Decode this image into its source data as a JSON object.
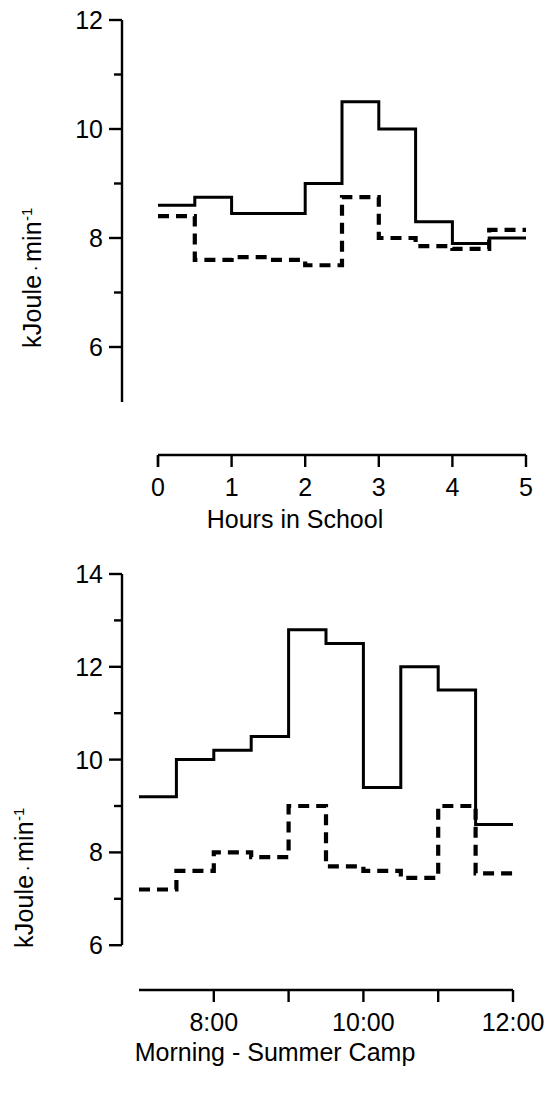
{
  "figure": {
    "background": "#ffffff",
    "line_color": "#000000",
    "panels": [
      "school",
      "camp"
    ]
  },
  "chart_data": [
    {
      "id": "school",
      "type": "line",
      "subtype": "step",
      "title": "",
      "xlabel": "Hours in School",
      "ylabel": "kJoule · min",
      "ylabel_exponent": "-1",
      "xlim": [
        0,
        5
      ],
      "ylim": [
        5.5,
        12
      ],
      "yticks": [
        6,
        8,
        10,
        12
      ],
      "yticklabels": [
        "6",
        "8",
        "10",
        "12"
      ],
      "yminorticks": [
        7,
        9,
        11
      ],
      "xticks": [
        0,
        1,
        2,
        3,
        4,
        5
      ],
      "xticklabels": [
        "0",
        "1",
        "2",
        "3",
        "4",
        "5"
      ],
      "grid": false,
      "legend": "none",
      "bin_width": 0.5,
      "series": [
        {
          "name": "solid",
          "style": "solid",
          "x": [
            0,
            0.5,
            1,
            1.5,
            2,
            2.5,
            3,
            3.5,
            4,
            4.5,
            5
          ],
          "values": [
            8.6,
            8.75,
            8.45,
            8.45,
            9.0,
            10.5,
            10.0,
            8.3,
            7.9,
            8.0,
            8.5
          ]
        },
        {
          "name": "dashed",
          "style": "dashed",
          "x": [
            0,
            0.5,
            1,
            1.5,
            2,
            2.5,
            3,
            3.5,
            4,
            4.5,
            5
          ],
          "values": [
            8.4,
            7.6,
            7.65,
            7.6,
            7.5,
            8.75,
            8.0,
            7.85,
            7.8,
            8.15,
            6.95
          ]
        }
      ]
    },
    {
      "id": "camp",
      "type": "line",
      "subtype": "step",
      "title": "",
      "xlabel": "Morning - Summer Camp",
      "ylabel": "kJoule · min",
      "ylabel_exponent": "-1",
      "xlim": [
        7,
        12
      ],
      "ylim": [
        6,
        14
      ],
      "yticks": [
        6,
        8,
        10,
        12,
        14
      ],
      "yticklabels": [
        "6",
        "8",
        "10",
        "12",
        "14"
      ],
      "yminorticks": [
        7,
        9,
        11,
        13
      ],
      "xticks": [
        8,
        9,
        10,
        11,
        12
      ],
      "xticklabels": [
        "8:00",
        "",
        "10:00",
        "",
        "12:00"
      ],
      "grid": false,
      "legend": "none",
      "bin_width": 0.5,
      "series": [
        {
          "name": "solid",
          "style": "solid",
          "x": [
            7,
            7.5,
            8,
            8.5,
            9,
            9.5,
            10,
            10.5,
            11,
            11.5,
            12
          ],
          "values": [
            9.2,
            10.0,
            10.2,
            10.5,
            12.8,
            12.5,
            9.4,
            12.0,
            11.5,
            8.6,
            8.6
          ]
        },
        {
          "name": "dashed",
          "style": "dashed",
          "x": [
            7,
            7.5,
            8,
            8.5,
            9,
            9.5,
            10,
            10.5,
            11,
            11.5,
            12
          ],
          "values": [
            7.2,
            7.6,
            8.0,
            7.9,
            9.0,
            7.7,
            7.6,
            7.45,
            9.0,
            7.55,
            7.55
          ]
        }
      ]
    }
  ],
  "panel_top": {
    "ylabel_main": "kJoule",
    "ylabel_sep": "·",
    "ylabel_unit": "min",
    "ylabel_exp": "-1",
    "xlabel": "Hours in School",
    "ytick_labels": [
      "12",
      "10",
      "8",
      "6"
    ],
    "xtick_labels": [
      "0",
      "1",
      "2",
      "3",
      "4",
      "5"
    ]
  },
  "panel_bottom": {
    "ylabel_main": "kJoule",
    "ylabel_sep": "·",
    "ylabel_unit": "min",
    "ylabel_exp": "-1",
    "xlabel": "Morning - Summer Camp",
    "ytick_labels": [
      "14",
      "12",
      "10",
      "8",
      "6"
    ],
    "xtick_labels": [
      "8:00",
      "10:00",
      "12:00"
    ]
  }
}
